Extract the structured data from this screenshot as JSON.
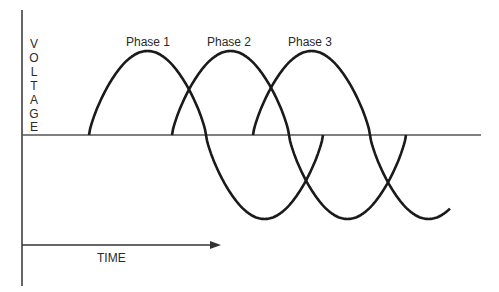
{
  "diagram": {
    "y_axis_label_letters": [
      "V",
      "O",
      "L",
      "T",
      "A",
      "G",
      "E"
    ],
    "x_axis_label": "TIME",
    "phases": [
      {
        "label": "Phase 1"
      },
      {
        "label": "Phase 2"
      },
      {
        "label": "Phase 3"
      }
    ],
    "colors": {
      "line": "#1a1a1a",
      "axis": "#333333",
      "background": "#ffffff"
    }
  }
}
